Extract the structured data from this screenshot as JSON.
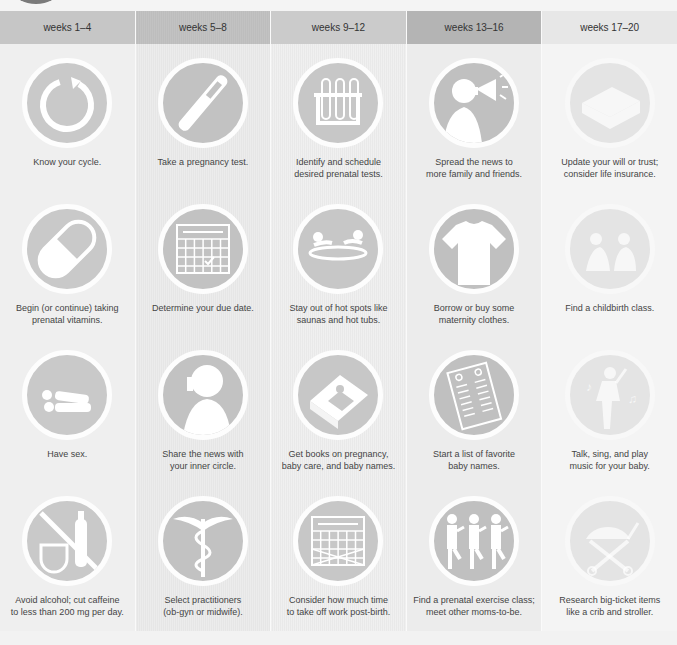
{
  "columns": [
    {
      "header": "weeks 1–4",
      "items": [
        {
          "icon": "cycle-arrow-icon",
          "caption": "Know your cycle."
        },
        {
          "icon": "vitamin-capsule-icon",
          "caption": "Begin (or continue) taking\nprenatal vitamins."
        },
        {
          "icon": "couple-lying-icon",
          "caption": "Have sex."
        },
        {
          "icon": "no-alcohol-caffeine-icon",
          "caption": "Avoid alcohol; cut caffeine\nto less than 200 mg per day."
        }
      ]
    },
    {
      "header": "weeks 5–8",
      "items": [
        {
          "icon": "pregnancy-test-icon",
          "caption": "Take a pregnancy test."
        },
        {
          "icon": "calendar-check-icon",
          "caption": "Determine your due date."
        },
        {
          "icon": "person-phone-icon",
          "caption": "Share the news with\nyour inner circle."
        },
        {
          "icon": "caduceus-icon",
          "caption": "Select practitioners\n(ob-gyn or midwife)."
        }
      ]
    },
    {
      "header": "weeks 9–12",
      "items": [
        {
          "icon": "test-tubes-icon",
          "caption": "Identify and schedule\ndesired prenatal tests."
        },
        {
          "icon": "hot-tub-icon",
          "caption": "Stay out of hot spots like\nsaunas and hot tubs."
        },
        {
          "icon": "book-icon",
          "caption": "Get books on pregnancy,\nbaby care, and baby names."
        },
        {
          "icon": "calendar-crossed-icon",
          "caption": "Consider how much time\nto take off work post-birth."
        }
      ]
    },
    {
      "header": "weeks 13–16",
      "items": [
        {
          "icon": "megaphone-person-icon",
          "caption": "Spread the news to\nmore family and friends."
        },
        {
          "icon": "t-shirt-icon",
          "caption": "Borrow or buy some\nmaternity clothes."
        },
        {
          "icon": "name-list-icon",
          "caption": "Start a list of favorite\nbaby names."
        },
        {
          "icon": "exercise-class-icon",
          "caption": "Find a prenatal exercise class;\nmeet other moms-to-be."
        }
      ]
    },
    {
      "header": "weeks 17–20",
      "items": [
        {
          "icon": "document-box-icon",
          "caption": "Update your will or trust;\nconsider life insurance."
        },
        {
          "icon": "childbirth-class-icon",
          "caption": "Find a childbirth class."
        },
        {
          "icon": "singing-person-icon",
          "caption": "Talk, sing, and play\nmusic for your baby."
        },
        {
          "icon": "stroller-icon",
          "caption": "Research big-ticket items\nlike a crib and stroller."
        }
      ]
    }
  ]
}
